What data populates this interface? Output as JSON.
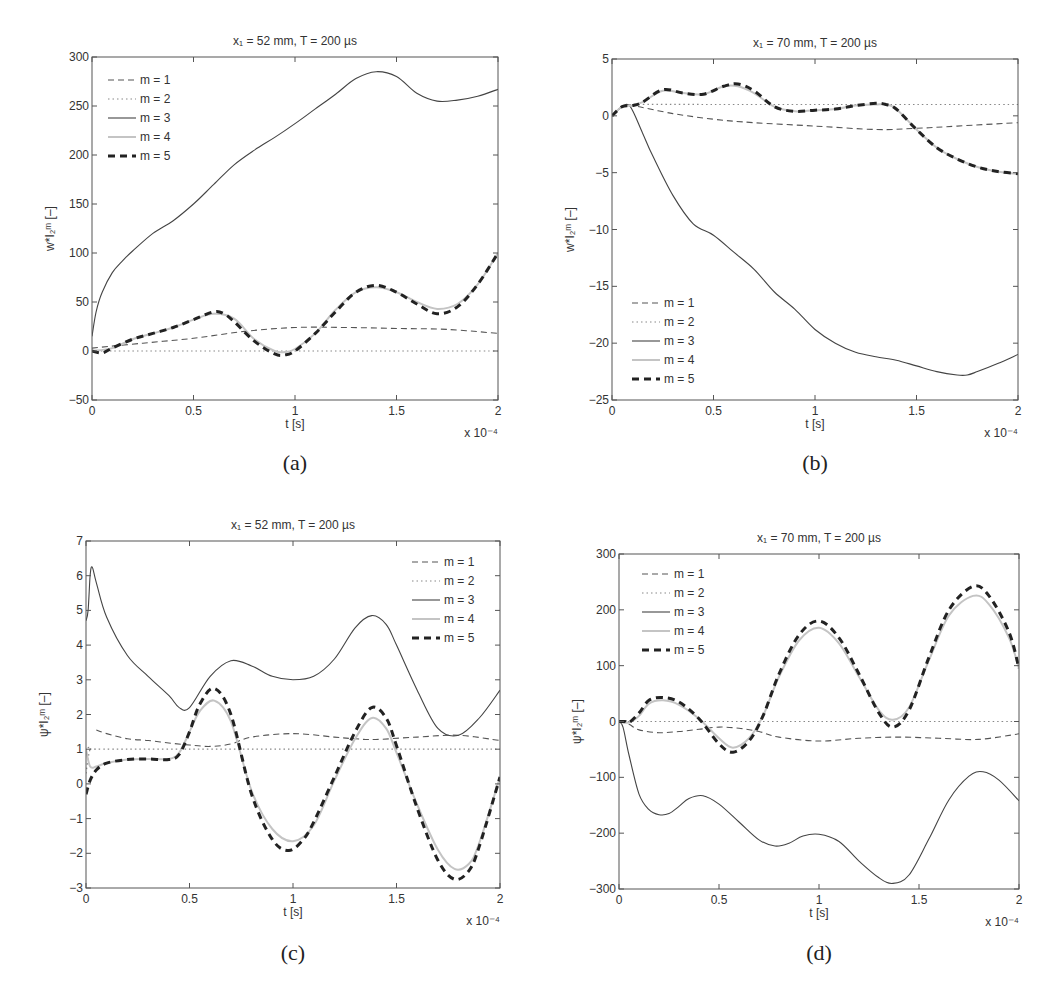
{
  "chart_data": [
    {
      "panel": "(a)",
      "type": "line",
      "title": "x₁ = 52 mm, T = 200 µs",
      "xlabel": "t [s]",
      "ylabel": "w*I₂ᵐ [–]",
      "x_multiplier": "x 10⁻⁴",
      "xlim": [
        0,
        2
      ],
      "ylim": [
        -50,
        300
      ],
      "xticks": [
        0,
        0.5,
        1,
        1.5,
        2
      ],
      "xtick_labels": [
        "0",
        "0.5",
        "1",
        "1.5",
        "2"
      ],
      "yticks": [
        -50,
        0,
        50,
        100,
        150,
        200,
        250,
        300
      ],
      "ytick_labels": [
        "-50",
        "0",
        "50",
        "100",
        "150",
        "200",
        "250",
        "300"
      ],
      "legend_position": "top-left",
      "series": [
        {
          "name": "m = 1",
          "style": "dashed",
          "x": [
            0,
            0.25,
            0.5,
            0.75,
            1.0,
            1.25,
            1.5,
            1.75,
            2.0
          ],
          "values": [
            3,
            8,
            13,
            20,
            24,
            24,
            23,
            22,
            18
          ]
        },
        {
          "name": "m = 2",
          "style": "dotted",
          "x": [
            0,
            0.5,
            1.0,
            1.5,
            2.0
          ],
          "values": [
            0,
            0,
            0,
            0,
            0
          ]
        },
        {
          "name": "m = 3",
          "style": "solid",
          "x": [
            0,
            0.02,
            0.05,
            0.1,
            0.15,
            0.2,
            0.3,
            0.4,
            0.5,
            0.6,
            0.7,
            0.8,
            0.9,
            1.0,
            1.1,
            1.2,
            1.3,
            1.4,
            1.5,
            1.6,
            1.7,
            1.8,
            1.9,
            2.0
          ],
          "values": [
            15,
            40,
            60,
            80,
            92,
            102,
            120,
            133,
            150,
            170,
            190,
            205,
            218,
            232,
            247,
            262,
            278,
            285,
            280,
            263,
            255,
            256,
            260,
            267
          ]
        },
        {
          "name": "m = 4",
          "style": "solid-light",
          "x": [
            0,
            0.1,
            0.2,
            0.3,
            0.4,
            0.5,
            0.6,
            0.7,
            0.8,
            0.9,
            0.95,
            1.0,
            1.1,
            1.2,
            1.3,
            1.4,
            1.5,
            1.6,
            1.7,
            1.8,
            1.9,
            2.0
          ],
          "values": [
            0,
            3,
            12,
            18,
            24,
            32,
            38,
            33,
            12,
            0,
            -1,
            2,
            18,
            42,
            60,
            65,
            60,
            50,
            43,
            48,
            68,
            100
          ]
        },
        {
          "name": "m = 5",
          "style": "dashed-bold",
          "x": [
            0,
            0.05,
            0.1,
            0.2,
            0.3,
            0.4,
            0.5,
            0.6,
            0.65,
            0.7,
            0.8,
            0.9,
            0.95,
            1.0,
            1.1,
            1.2,
            1.3,
            1.4,
            1.5,
            1.6,
            1.7,
            1.8,
            1.9,
            2.0
          ],
          "values": [
            0,
            -2,
            3,
            12,
            18,
            24,
            32,
            40,
            38,
            30,
            10,
            -3,
            -4,
            0,
            18,
            40,
            60,
            67,
            60,
            48,
            38,
            45,
            68,
            100
          ]
        }
      ]
    },
    {
      "panel": "(b)",
      "type": "line",
      "title": "x₁ = 70 mm, T = 200 µs",
      "xlabel": "t [s]",
      "ylabel": "w*I₂ᵐ [–]",
      "x_multiplier": "x 10⁻⁴",
      "xlim": [
        0,
        2
      ],
      "ylim": [
        -25,
        5
      ],
      "xticks": [
        0,
        0.5,
        1,
        1.5,
        2
      ],
      "xtick_labels": [
        "0",
        "0.5",
        "1",
        "1.5",
        "2"
      ],
      "yticks": [
        -25,
        -20,
        -15,
        -10,
        -5,
        0,
        5
      ],
      "ytick_labels": [
        "-25",
        "-20",
        "-15",
        "-10",
        "-5",
        "0",
        "5"
      ],
      "legend_position": "bottom-left",
      "series": [
        {
          "name": "m = 1",
          "style": "dashed",
          "x": [
            0,
            0.05,
            0.1,
            0.3,
            0.5,
            0.7,
            1.0,
            1.3,
            1.5,
            1.7,
            2.0
          ],
          "values": [
            0,
            0.8,
            0.9,
            0.2,
            -0.3,
            -0.6,
            -0.9,
            -1.2,
            -1.1,
            -0.9,
            -0.6
          ]
        },
        {
          "name": "m = 2",
          "style": "dotted",
          "x": [
            0,
            0.05,
            0.1,
            0.5,
            1.0,
            1.5,
            2.0
          ],
          "values": [
            0,
            0.8,
            1.0,
            1.0,
            1.0,
            1.0,
            1.0
          ]
        },
        {
          "name": "m = 3",
          "style": "solid",
          "x": [
            0,
            0.05,
            0.09,
            0.15,
            0.2,
            0.3,
            0.4,
            0.5,
            0.6,
            0.7,
            0.8,
            0.9,
            1.0,
            1.1,
            1.2,
            1.3,
            1.4,
            1.5,
            1.6,
            1.7,
            1.75,
            1.8,
            1.9,
            2.0
          ],
          "values": [
            0,
            0.8,
            0.8,
            -1.5,
            -3.5,
            -7,
            -9.5,
            -10.5,
            -12,
            -13.5,
            -15.5,
            -17,
            -18.8,
            -20,
            -20.8,
            -21.2,
            -21.5,
            -22,
            -22.5,
            -22.8,
            -22.8,
            -22.5,
            -21.8,
            -21
          ]
        },
        {
          "name": "m = 4",
          "style": "solid-light",
          "x": [
            0,
            0.05,
            0.1,
            0.15,
            0.25,
            0.35,
            0.45,
            0.55,
            0.62,
            0.7,
            0.8,
            0.9,
            1.0,
            1.1,
            1.2,
            1.3,
            1.35,
            1.4,
            1.5,
            1.6,
            1.7,
            1.8,
            1.9,
            2.0
          ],
          "values": [
            0,
            0.8,
            0.9,
            1.2,
            2.2,
            2.0,
            1.9,
            2.6,
            2.6,
            2.0,
            0.8,
            0.4,
            0.5,
            0.6,
            0.9,
            1.0,
            1.0,
            0.6,
            -1.2,
            -2.8,
            -3.8,
            -4.5,
            -4.9,
            -5.1
          ]
        },
        {
          "name": "m = 5",
          "style": "dashed-bold",
          "x": [
            0,
            0.05,
            0.1,
            0.15,
            0.25,
            0.35,
            0.45,
            0.55,
            0.62,
            0.7,
            0.8,
            0.9,
            1.0,
            1.1,
            1.2,
            1.3,
            1.35,
            1.4,
            1.5,
            1.6,
            1.7,
            1.8,
            1.9,
            2.0
          ],
          "values": [
            0,
            0.8,
            0.9,
            1.2,
            2.3,
            2.0,
            1.9,
            2.6,
            2.8,
            2.2,
            0.8,
            0.4,
            0.5,
            0.6,
            0.9,
            1.1,
            1.0,
            0.6,
            -1.2,
            -2.8,
            -3.8,
            -4.5,
            -4.9,
            -5.1
          ]
        }
      ]
    },
    {
      "panel": "(c)",
      "type": "line",
      "title": "x₁ = 52 mm, T = 200 µs",
      "xlabel": "t [s]",
      "ylabel": "ψ*I₂ᵐ [–]",
      "x_multiplier": "x 10⁻⁴",
      "xlim": [
        0,
        2
      ],
      "ylim": [
        -3,
        7
      ],
      "xticks": [
        0,
        0.5,
        1,
        1.5,
        2
      ],
      "xtick_labels": [
        "0",
        "0.5",
        "1",
        "1.5",
        "2"
      ],
      "yticks": [
        -3,
        -2,
        -1,
        0,
        1,
        2,
        3,
        4,
        5,
        6,
        7
      ],
      "ytick_labels": [
        "-3",
        "-2",
        "-1",
        "0",
        "1",
        "2",
        "3",
        "4",
        "5",
        "6",
        "7"
      ],
      "legend_position": "top-right",
      "series": [
        {
          "name": "m = 1",
          "style": "dashed",
          "x": [
            0.05,
            0.1,
            0.2,
            0.3,
            0.4,
            0.5,
            0.6,
            0.7,
            0.8,
            1.0,
            1.2,
            1.3,
            1.4,
            1.6,
            1.8,
            2.0
          ],
          "values": [
            1.55,
            1.45,
            1.3,
            1.25,
            1.18,
            1.12,
            1.08,
            1.15,
            1.35,
            1.45,
            1.35,
            1.3,
            1.28,
            1.35,
            1.4,
            1.25
          ]
        },
        {
          "name": "m = 2",
          "style": "dotted",
          "x": [
            0,
            0.02,
            0.05,
            0.5,
            1.0,
            1.5,
            2.0
          ],
          "values": [
            0.3,
            1.0,
            1.0,
            1.0,
            1.0,
            1.0,
            1.0
          ]
        },
        {
          "name": "m = 3",
          "style": "solid",
          "x": [
            0,
            0.01,
            0.02,
            0.03,
            0.05,
            0.1,
            0.2,
            0.3,
            0.4,
            0.45,
            0.5,
            0.6,
            0.7,
            0.8,
            0.9,
            1.0,
            1.1,
            1.2,
            1.3,
            1.38,
            1.45,
            1.5,
            1.6,
            1.7,
            1.8,
            1.9,
            2.0
          ],
          "values": [
            4.7,
            5.0,
            6.0,
            6.25,
            5.8,
            4.8,
            3.7,
            3.1,
            2.55,
            2.2,
            2.2,
            3.1,
            3.55,
            3.4,
            3.1,
            3.0,
            3.1,
            3.6,
            4.5,
            4.85,
            4.6,
            4.0,
            2.7,
            1.6,
            1.4,
            1.9,
            2.7
          ]
        },
        {
          "name": "m = 4",
          "style": "solid-light",
          "x": [
            0,
            0.02,
            0.05,
            0.1,
            0.2,
            0.3,
            0.4,
            0.45,
            0.5,
            0.55,
            0.62,
            0.7,
            0.8,
            0.9,
            1.0,
            1.1,
            1.2,
            1.3,
            1.38,
            1.45,
            1.5,
            1.6,
            1.7,
            1.78,
            1.85,
            1.9,
            2.0
          ],
          "values": [
            1.0,
            0.5,
            0.5,
            0.6,
            0.7,
            0.72,
            0.72,
            0.9,
            1.5,
            2.1,
            2.4,
            1.8,
            -0.2,
            -1.3,
            -1.65,
            -1.2,
            0.1,
            1.3,
            1.9,
            1.6,
            0.9,
            -0.6,
            -1.9,
            -2.45,
            -2.3,
            -1.7,
            0.2
          ]
        },
        {
          "name": "m = 5",
          "style": "dashed-bold",
          "x": [
            0,
            0.02,
            0.05,
            0.1,
            0.2,
            0.3,
            0.4,
            0.45,
            0.5,
            0.55,
            0.62,
            0.7,
            0.8,
            0.9,
            0.98,
            1.05,
            1.1,
            1.2,
            1.3,
            1.38,
            1.45,
            1.5,
            1.6,
            1.7,
            1.78,
            1.85,
            1.9,
            2.0
          ],
          "values": [
            -0.3,
            0.1,
            0.4,
            0.6,
            0.7,
            0.72,
            0.7,
            0.85,
            1.5,
            2.3,
            2.75,
            2.0,
            -0.3,
            -1.6,
            -1.92,
            -1.6,
            -1.1,
            0.2,
            1.5,
            2.2,
            1.9,
            1.1,
            -0.7,
            -2.2,
            -2.75,
            -2.5,
            -1.8,
            0.2
          ]
        }
      ]
    },
    {
      "panel": "(d)",
      "type": "line",
      "title": "x₁ = 70 mm, T = 200 µs",
      "xlabel": "t [s]",
      "ylabel": "ψ*I₂ᵐ [–]",
      "x_multiplier": "x 10⁻⁴",
      "xlim": [
        0,
        2
      ],
      "ylim": [
        -300,
        300
      ],
      "xticks": [
        0,
        0.5,
        1,
        1.5,
        2
      ],
      "xtick_labels": [
        "0",
        "0.5",
        "1",
        "1.5",
        "2"
      ],
      "yticks": [
        -300,
        -200,
        -100,
        0,
        100,
        200,
        300
      ],
      "ytick_labels": [
        "-300",
        "-200",
        "-100",
        "0",
        "100",
        "200",
        "300"
      ],
      "legend_position": "top-left",
      "series": [
        {
          "name": "m = 1",
          "style": "dashed",
          "x": [
            0,
            0.05,
            0.1,
            0.2,
            0.3,
            0.4,
            0.5,
            0.6,
            0.7,
            0.8,
            1.0,
            1.2,
            1.4,
            1.6,
            1.8,
            2.0
          ],
          "values": [
            0,
            -5,
            -15,
            -20,
            -18,
            -14,
            -10,
            -12,
            -18,
            -28,
            -35,
            -30,
            -28,
            -30,
            -32,
            -22
          ]
        },
        {
          "name": "m = 2",
          "style": "dotted",
          "x": [
            0,
            0.5,
            1.0,
            1.5,
            2.0
          ],
          "values": [
            0,
            0,
            0,
            0,
            0
          ]
        },
        {
          "name": "m = 3",
          "style": "solid",
          "x": [
            0,
            0.02,
            0.05,
            0.1,
            0.15,
            0.2,
            0.25,
            0.3,
            0.35,
            0.42,
            0.5,
            0.6,
            0.7,
            0.78,
            0.85,
            0.92,
            1.0,
            1.1,
            1.2,
            1.3,
            1.37,
            1.45,
            1.55,
            1.65,
            1.75,
            1.82,
            1.9,
            2.0
          ],
          "values": [
            0,
            -10,
            -60,
            -130,
            -158,
            -167,
            -165,
            -152,
            -138,
            -133,
            -148,
            -180,
            -212,
            -223,
            -218,
            -205,
            -202,
            -215,
            -250,
            -280,
            -290,
            -275,
            -210,
            -140,
            -98,
            -90,
            -105,
            -142
          ]
        },
        {
          "name": "m = 4",
          "style": "solid-light",
          "x": [
            0,
            0.05,
            0.1,
            0.15,
            0.22,
            0.3,
            0.4,
            0.5,
            0.57,
            0.65,
            0.72,
            0.8,
            0.9,
            1.0,
            1.1,
            1.2,
            1.3,
            1.37,
            1.45,
            1.55,
            1.65,
            1.77,
            1.85,
            1.95,
            2.0
          ],
          "values": [
            0,
            -2,
            10,
            32,
            38,
            30,
            5,
            -30,
            -47,
            -30,
            10,
            80,
            145,
            168,
            140,
            80,
            20,
            3,
            25,
            110,
            190,
            225,
            210,
            150,
            95
          ]
        },
        {
          "name": "m = 5",
          "style": "dashed-bold",
          "x": [
            0,
            0.03,
            0.05,
            0.1,
            0.15,
            0.22,
            0.3,
            0.4,
            0.5,
            0.57,
            0.65,
            0.72,
            0.8,
            0.9,
            1.0,
            1.1,
            1.2,
            1.3,
            1.37,
            1.45,
            1.55,
            1.65,
            1.77,
            1.85,
            1.95,
            2.0
          ],
          "values": [
            0,
            0,
            -2,
            15,
            38,
            43,
            35,
            5,
            -40,
            -55,
            -35,
            10,
            85,
            155,
            180,
            150,
            85,
            15,
            -10,
            20,
            115,
            200,
            242,
            225,
            160,
            95
          ]
        }
      ]
    }
  ],
  "panel_labels": [
    "(a)",
    "(b)",
    "(c)",
    "(d)"
  ],
  "legend_styles": {
    "dashed": {
      "color": "#555555"
    },
    "dotted": {
      "color": "#888888"
    },
    "solid": {
      "color": "#444444"
    },
    "solid-light": {
      "color": "#bbbbbb"
    },
    "dashed-bold": {
      "color": "#222222"
    }
  }
}
